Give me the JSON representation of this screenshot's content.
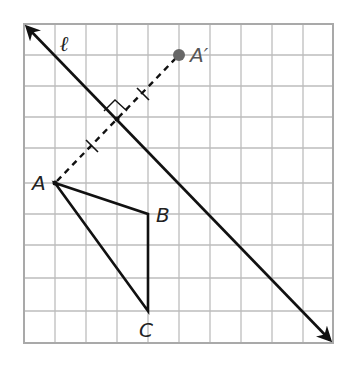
{
  "diagram": {
    "type": "reflection-on-grid",
    "grid": {
      "columns": 10,
      "rows": 10,
      "origin_px": [
        24,
        24
      ],
      "cell_px": 31
    },
    "line": {
      "label": "ℓ",
      "from_grid": [
        0,
        0
      ],
      "to_grid": [
        10,
        10.3
      ]
    },
    "points": {
      "A": {
        "label": "A",
        "grid": [
          1,
          5
        ]
      },
      "B": {
        "label": "B",
        "grid": [
          4,
          6
        ]
      },
      "C": {
        "label": "C",
        "grid": [
          4,
          9.2
        ]
      },
      "A_prime": {
        "label": "A′",
        "grid": [
          5,
          1
        ]
      }
    },
    "triangle": [
      "A",
      "B",
      "C"
    ],
    "segment": {
      "from": "A",
      "to": "A_prime",
      "style": "dashed",
      "congruence_ticks": 2,
      "right_angle_mark": true
    },
    "colors": {
      "grid": "#bdbdbd",
      "line": "#111111",
      "image_point": "#666666"
    }
  }
}
